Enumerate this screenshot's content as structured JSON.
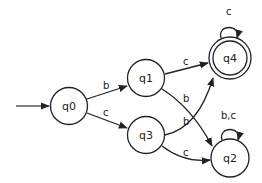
{
  "diagram": {
    "type": "finite-automaton",
    "states": [
      {
        "id": "q0",
        "label": "q0",
        "cx": 69,
        "cy": 106,
        "initial": true,
        "accepting": false
      },
      {
        "id": "q1",
        "label": "q1",
        "cx": 146,
        "cy": 78,
        "initial": false,
        "accepting": false
      },
      {
        "id": "q3",
        "label": "q3",
        "cx": 146,
        "cy": 135,
        "initial": false,
        "accepting": false
      },
      {
        "id": "q4",
        "label": "q4",
        "cx": 230,
        "cy": 58,
        "initial": false,
        "accepting": true
      },
      {
        "id": "q2",
        "label": "q2",
        "cx": 230,
        "cy": 158,
        "initial": false,
        "accepting": false
      }
    ],
    "transitions": [
      {
        "from": "q0",
        "to": "q1",
        "label": "b"
      },
      {
        "from": "q0",
        "to": "q3",
        "label": "c"
      },
      {
        "from": "q1",
        "to": "q4",
        "label": "c"
      },
      {
        "from": "q1",
        "to": "q2",
        "label": "b"
      },
      {
        "from": "q3",
        "to": "q4",
        "label": "b"
      },
      {
        "from": "q3",
        "to": "q2",
        "label": "c"
      },
      {
        "from": "q4",
        "to": "q4",
        "label": "c"
      },
      {
        "from": "q2",
        "to": "q2",
        "label": "b,c"
      }
    ]
  },
  "labels": {
    "q0": "q0",
    "q1": "q1",
    "q2": "q2",
    "q3": "q3",
    "q4": "q4",
    "e_q0_q1": "b",
    "e_q0_q3": "c",
    "e_q1_q4": "c",
    "e_q1_q2": "b",
    "e_q3_q4": "b",
    "e_q3_q2": "c",
    "e_q4_q4": "c",
    "e_q2_q2": "b,c"
  }
}
